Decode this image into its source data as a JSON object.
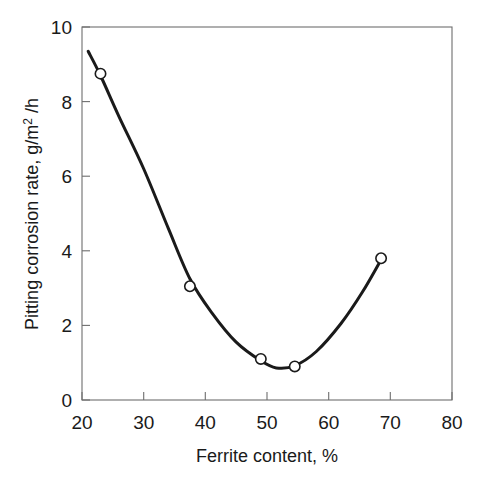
{
  "chart_data": {
    "type": "line",
    "title": "",
    "subtitle": "",
    "xlabel": "Ferrite content, %",
    "ylabel_full": "Pitting corrosion rate, g/m2 /h",
    "ylabel_part1": "Pitting corrosion rate, g/m",
    "ylabel_superscript": "2",
    "ylabel_part2": " /h",
    "xlim": [
      20,
      80
    ],
    "ylim": [
      0,
      10
    ],
    "xticks": [
      20,
      30,
      40,
      50,
      60,
      70,
      80
    ],
    "xtick_labels": [
      "20",
      "30",
      "40",
      "50",
      "60",
      "70",
      "80"
    ],
    "yticks": [
      0,
      2,
      4,
      6,
      8,
      10
    ],
    "ytick_labels": [
      "0",
      "2",
      "4",
      "6",
      "8",
      "10"
    ],
    "grid": false,
    "legend": "none",
    "series": [
      {
        "name": "Pitting corrosion rate",
        "marker": "open-circle",
        "line_color": "#1a1a1a",
        "marker_face_color": "#ffffff",
        "x": [
          23.0,
          37.5,
          49.0,
          54.5,
          68.5
        ],
        "y": [
          8.75,
          3.05,
          1.1,
          0.9,
          3.8
        ]
      }
    ],
    "fitted_curve": {
      "description": "smooth U-shaped trend line through data points",
      "x": [
        21.0,
        23.0,
        26.0,
        30.0,
        34.0,
        37.5,
        41.0,
        45.0,
        49.0,
        51.5,
        54.5,
        58.0,
        62.0,
        65.5,
        68.8
      ],
      "y": [
        9.35,
        8.7,
        7.6,
        6.2,
        4.6,
        3.25,
        2.35,
        1.55,
        1.05,
        0.86,
        0.92,
        1.3,
        2.05,
        2.9,
        3.85
      ]
    }
  },
  "axes": {
    "x_axis_name": "x-axis",
    "y_axis_name": "y-axis"
  }
}
